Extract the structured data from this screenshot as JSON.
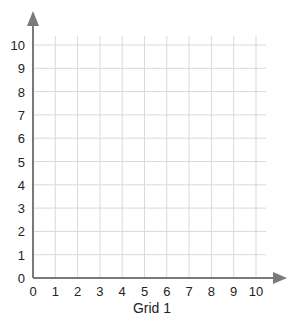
{
  "chart_data": {
    "type": "grid",
    "title": "Grid 1",
    "xlabel": "",
    "ylabel": "",
    "xlim": [
      0,
      10
    ],
    "ylim": [
      0,
      10
    ],
    "grid": true,
    "x_ticks": [
      "0",
      "1",
      "2",
      "3",
      "4",
      "5",
      "6",
      "7",
      "8",
      "9",
      "10"
    ],
    "y_ticks": [
      "0",
      "1",
      "2",
      "3",
      "4",
      "5",
      "6",
      "7",
      "8",
      "9",
      "10"
    ],
    "series": []
  },
  "caption": "Grid 1",
  "colors": {
    "axis": "#7a7a7a",
    "grid": "#d9d9d9",
    "text": "#222222"
  }
}
